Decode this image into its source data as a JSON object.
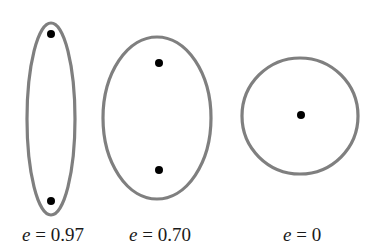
{
  "diagram": {
    "stroke_color": "#7f7f7f",
    "focus_color": "#000000",
    "orbits": [
      {
        "name": "ellipse-high-eccentricity",
        "label_var": "e",
        "label_eq": " = ",
        "label_value": "0.97",
        "eccentricity": 0.97,
        "center": [
          51,
          119
        ],
        "rx": 24,
        "ry": 96,
        "foci": [
          [
            51,
            34
          ],
          [
            51,
            201
          ]
        ]
      },
      {
        "name": "ellipse-medium-eccentricity",
        "label_var": "e",
        "label_eq": " = ",
        "label_value": "0.70",
        "eccentricity": 0.7,
        "center": [
          157,
          118
        ],
        "rx": 54,
        "ry": 81,
        "foci": [
          [
            159,
            63
          ],
          [
            159,
            170
          ]
        ]
      },
      {
        "name": "circle-zero-eccentricity",
        "label_var": "e",
        "label_eq": " = ",
        "label_value": "0",
        "eccentricity": 0,
        "center": [
          300,
          116
        ],
        "rx": 58,
        "ry": 58,
        "foci": [
          [
            301,
            115
          ]
        ]
      }
    ]
  }
}
